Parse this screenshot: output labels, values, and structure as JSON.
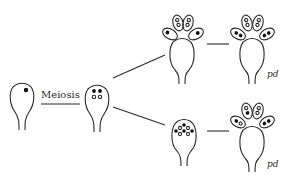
{
  "figure": {
    "process_label": "Meiosis",
    "result_labels": [
      "pd",
      "pd"
    ]
  },
  "colors": {
    "stroke": "#2a2a2a",
    "fill_dark": "#111111",
    "background": "#ffffff"
  }
}
